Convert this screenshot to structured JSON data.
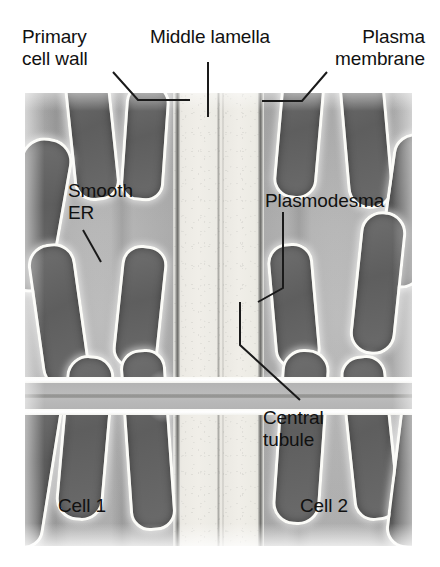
{
  "figure": {
    "type": "biology-diagram"
  },
  "labels": {
    "primary_cell_wall": "Primary\ncell wall",
    "middle_lamella": "Middle lamella",
    "plasma_membrane": "Plasma\nmembrane",
    "smooth_er": "Smooth\nER",
    "plasmodesma": "Plasmodesma",
    "central_tubule": "Central\ntubule",
    "cell_1": "Cell 1",
    "cell_2": "Cell 2"
  },
  "colors": {
    "background": "#ffffff",
    "text": "#111111",
    "leader_line": "#1a1a1a",
    "cytoplasm": "#b5b5b5",
    "cell_wall": "#efede7",
    "plasma_membrane": "#6e6e6b",
    "middle_lamella": "#78786c",
    "er_lumen": "#656565",
    "er_membrane": "#fbfbf7"
  },
  "structures": {
    "er_lobes_left": [
      {
        "name": "er-lobe-l1",
        "left": 44,
        "top": -26,
        "width": 40,
        "height": 128,
        "radius": "22px 22px 20px 20px",
        "rotate": -6
      },
      {
        "name": "er-lobe-l2",
        "left": -14,
        "top": 44,
        "width": 46,
        "height": 150,
        "radius": "24px",
        "rotate": 10
      },
      {
        "name": "er-lobe-l3",
        "left": 98,
        "top": -10,
        "width": 38,
        "height": 112,
        "radius": "20px 20px 18px 18px",
        "rotate": 4
      },
      {
        "name": "er-lobe-l4",
        "left": 10,
        "top": 150,
        "width": 42,
        "height": 140,
        "radius": "22px",
        "rotate": -8
      },
      {
        "name": "er-lobe-l5",
        "left": 92,
        "top": 152,
        "width": 40,
        "height": 118,
        "radius": "20px",
        "rotate": 6
      },
      {
        "name": "er-lobe-l6",
        "left": 36,
        "top": 262,
        "width": 42,
        "height": 160,
        "radius": "22px",
        "rotate": 5
      },
      {
        "name": "er-lobe-l7",
        "left": 100,
        "top": 256,
        "width": 40,
        "height": 176,
        "radius": "20px",
        "rotate": -4
      },
      {
        "name": "er-lobe-l8",
        "left": -18,
        "top": 300,
        "width": 40,
        "height": 150,
        "radius": "20px",
        "rotate": 9
      }
    ],
    "er_lobes_right": [
      {
        "name": "er-lobe-r1",
        "left": 252,
        "top": -20,
        "width": 38,
        "height": 120,
        "radius": "20px",
        "rotate": 5
      },
      {
        "name": "er-lobe-r2",
        "left": 318,
        "top": -30,
        "width": 40,
        "height": 140,
        "radius": "22px",
        "rotate": -5
      },
      {
        "name": "er-lobe-r3",
        "left": 360,
        "top": 40,
        "width": 40,
        "height": 150,
        "radius": "22px",
        "rotate": 8
      },
      {
        "name": "er-lobe-r4",
        "left": 246,
        "top": 150,
        "width": 40,
        "height": 120,
        "radius": "20px",
        "rotate": -5
      },
      {
        "name": "er-lobe-r5",
        "left": 330,
        "top": 118,
        "width": 40,
        "height": 138,
        "radius": "22px",
        "rotate": 6
      },
      {
        "name": "er-lobe-r6",
        "left": 252,
        "top": 256,
        "width": 42,
        "height": 170,
        "radius": "22px",
        "rotate": 4
      },
      {
        "name": "er-lobe-r7",
        "left": 322,
        "top": 262,
        "width": 40,
        "height": 160,
        "radius": "20px",
        "rotate": -6
      },
      {
        "name": "er-lobe-r8",
        "left": 368,
        "top": 300,
        "width": 38,
        "height": 150,
        "radius": "20px",
        "rotate": 7
      }
    ],
    "cyto_bands": [
      {
        "name": "cyto-band-1",
        "left": 18,
        "width": 26
      },
      {
        "name": "cyto-band-2",
        "left": 86,
        "width": 22
      },
      {
        "name": "cyto-band-3",
        "left": 262,
        "width": 24
      },
      {
        "name": "cyto-band-4",
        "left": 344,
        "width": 26
      }
    ],
    "leader_lines": [
      {
        "name": "leader-primary-cell-wall",
        "points": "113,72 138,100 190,100"
      },
      {
        "name": "leader-middle-lamella",
        "points": "208,62 208,117"
      },
      {
        "name": "leader-plasma-membrane",
        "points": "327,72 302,101 262,101"
      },
      {
        "name": "leader-smooth-er",
        "points": "83,230 101,262"
      },
      {
        "name": "leader-plasmodesma",
        "points": "283,212 283,288 258,302"
      },
      {
        "name": "leader-central-tubule",
        "points": "240,302 240,345 300,400"
      }
    ]
  }
}
